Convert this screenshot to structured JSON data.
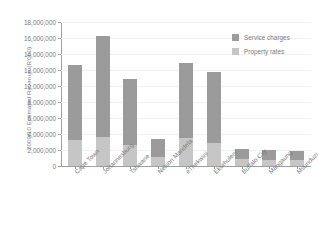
{
  "chart_data": {
    "type": "bar",
    "subtype": "stacked-vertical",
    "title": "",
    "xlabel": "",
    "ylabel": "2009/10 Estimated Revenue (R'000)",
    "ylim": [
      0,
      18000000
    ],
    "ytick_values": [
      0,
      2000000,
      4000000,
      6000000,
      8000000,
      10000000,
      12000000,
      14000000,
      16000000,
      18000000
    ],
    "ytick_labels": [
      "0",
      "2,000,000",
      "4,000,000",
      "6,000,000",
      "8,000,000",
      "10,000,000",
      "12,000,000",
      "14,000,000",
      "16,000,000",
      "18,000,000"
    ],
    "grid": true,
    "legend_position": "top-right",
    "categories": [
      "Cape Town",
      "Johannesburg",
      "Tshwane",
      "Nelson Mandela",
      "eThekwini",
      "Ekurhuleni",
      "Buffalo City",
      "Mangaung",
      "Msunduzi"
    ],
    "series": [
      {
        "name": "Property rates",
        "color": "#c6c6c6",
        "values": [
          3300000,
          3600000,
          2600000,
          1100000,
          3500000,
          2900000,
          900000,
          800000,
          700000
        ]
      },
      {
        "name": "Service charges",
        "color": "#9b9b9b",
        "values": [
          9300000,
          12700000,
          8300000,
          2300000,
          9400000,
          8900000,
          1200000,
          1200000,
          1200000
        ]
      }
    ],
    "totals": [
      12600000,
      16300000,
      10900000,
      3400000,
      12900000,
      11800000,
      2100000,
      2000000,
      1900000
    ]
  },
  "legend": {
    "items": [
      {
        "label": "Service charges",
        "color": "#9b9b9b"
      },
      {
        "label": "Property rates",
        "color": "#c6c6c6"
      }
    ]
  }
}
